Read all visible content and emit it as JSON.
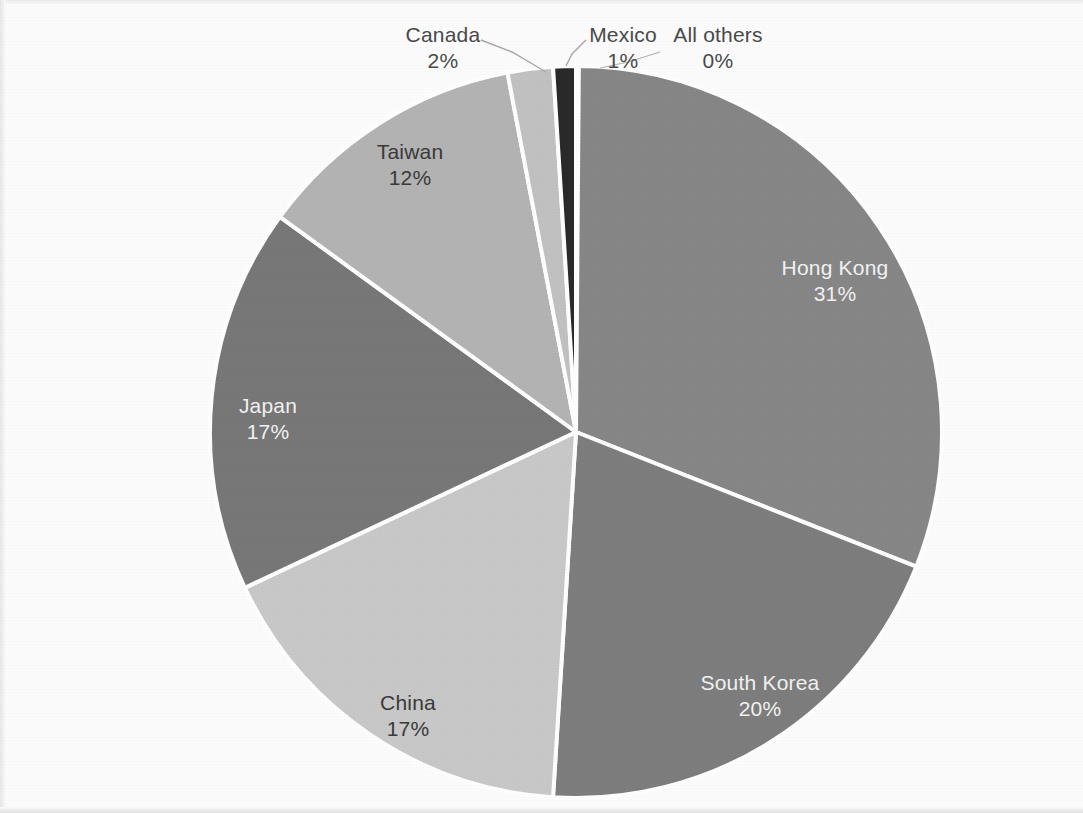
{
  "chart_data": {
    "type": "pie",
    "title": "",
    "subtitle": "",
    "legend_position": "none",
    "labels_style": "category name and percentage on slice",
    "categories": [
      "Hong Kong",
      "South Korea",
      "China",
      "Japan",
      "Taiwan",
      "Canada",
      "Mexico",
      "All others"
    ],
    "values": [
      31,
      20,
      17,
      17,
      12,
      2,
      1,
      0
    ],
    "value_labels": [
      "31%",
      "20%",
      "17%",
      "17%",
      "12%",
      "2%",
      "1%",
      "0%"
    ],
    "colors": [
      "#878787",
      "#7e7e7e",
      "#c9c9c9",
      "#787878",
      "#b4b4b4",
      "#c2c2c2",
      "#2a2a2a",
      "#8a8a8a"
    ],
    "slice_border_color": "#ffffff",
    "start_angle_deg": 0,
    "direction": "clockwise",
    "xlabel": "",
    "ylabel": ""
  },
  "slices": [
    {
      "name": "Hong Kong",
      "pct": "31%",
      "color": "#878787",
      "label_color": "light",
      "label_x": 835,
      "label_y": 255
    },
    {
      "name": "South Korea",
      "pct": "20%",
      "color": "#7e7e7e",
      "label_color": "light",
      "label_x": 760,
      "label_y": 670
    },
    {
      "name": "China",
      "pct": "17%",
      "color": "#c9c9c9",
      "label_color": "dark",
      "label_x": 408,
      "label_y": 690
    },
    {
      "name": "Japan",
      "pct": "17%",
      "color": "#787878",
      "label_color": "light",
      "label_x": 268,
      "label_y": 393
    },
    {
      "name": "Taiwan",
      "pct": "12%",
      "color": "#b4b4b4",
      "label_color": "dark",
      "label_x": 410,
      "label_y": 139
    },
    {
      "name": "Canada",
      "pct": "2%",
      "color": "#c2c2c2",
      "label_color": "outside",
      "label_x": 443,
      "label_y": 22
    },
    {
      "name": "Mexico",
      "pct": "1%",
      "color": "#2a2a2a",
      "label_color": "outside",
      "label_x": 623,
      "label_y": 22
    },
    {
      "name": "All others",
      "pct": "0%",
      "color": "#8a8a8a",
      "label_color": "outside",
      "label_x": 718,
      "label_y": 22
    }
  ]
}
